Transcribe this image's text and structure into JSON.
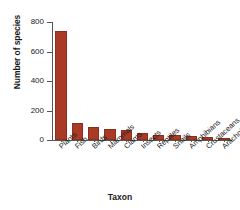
{
  "chart_data": {
    "type": "bar",
    "title": "",
    "xlabel": "Taxon",
    "ylabel": "Number of species",
    "categories": [
      "Plants",
      "Fish",
      "Birds",
      "Mammals",
      "Clams",
      "Insects",
      "Reptiles",
      "Snails",
      "Amphibians",
      "Crustaceans",
      "Arachnids"
    ],
    "values": [
      740,
      115,
      90,
      75,
      70,
      45,
      36,
      32,
      25,
      22,
      10
    ],
    "series": [
      {
        "name": "Number of species",
        "values": [
          740,
          115,
          90,
          75,
          70,
          45,
          36,
          32,
          25,
          22,
          10
        ]
      }
    ],
    "ylim": [
      0,
      800
    ],
    "yticks": [
      0,
      200,
      400,
      600,
      800
    ],
    "ytick_labels": [
      "0",
      "200",
      "400",
      "600",
      "800"
    ],
    "grid": false,
    "legend": false,
    "bar_color": "#a93a26",
    "bar_edge_color": "#8d2d1c",
    "axis_color": "#555555",
    "background": "#ffffff"
  }
}
